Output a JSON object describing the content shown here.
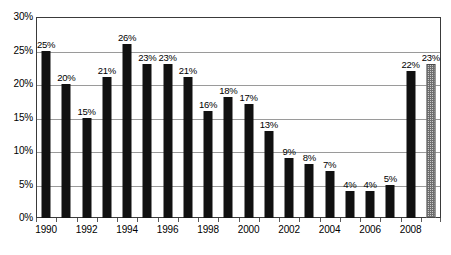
{
  "chart_data": {
    "type": "bar",
    "title": "",
    "subtitle": "",
    "xlabel": "",
    "ylabel": "",
    "categories": [
      "1990",
      "1991",
      "1992",
      "1993",
      "1994",
      "1995",
      "1996",
      "1997",
      "1998",
      "1999",
      "2000",
      "2001",
      "2002",
      "2003",
      "2004",
      "2005",
      "2006",
      "2007",
      "2008",
      "2009"
    ],
    "values": [
      25,
      20,
      15,
      21,
      26,
      23,
      23,
      21,
      16,
      18,
      17,
      13,
      9,
      8,
      7,
      4,
      4,
      5,
      22,
      23
    ],
    "data_labels": [
      "25%",
      "20%",
      "15%",
      "21%",
      "26%",
      "23%",
      "23%",
      "21%",
      "16%",
      "18%",
      "17%",
      "13%",
      "9%",
      "8%",
      "7%",
      "4%",
      "4%",
      "5%",
      "22%",
      "23%"
    ],
    "bar_styles": [
      "solid",
      "solid",
      "solid",
      "solid",
      "solid",
      "solid",
      "solid",
      "solid",
      "solid",
      "solid",
      "solid",
      "solid",
      "solid",
      "solid",
      "solid",
      "solid",
      "solid",
      "solid",
      "solid",
      "hatched"
    ],
    "ylim": [
      0,
      30
    ],
    "ytick_values": [
      0,
      5,
      10,
      15,
      20,
      25,
      30
    ],
    "ytick_labels": [
      "0%",
      "5%",
      "10%",
      "15%",
      "20%",
      "25%",
      "30%"
    ],
    "xtick_labels": [
      "1990",
      "1992",
      "1994",
      "1996",
      "1998",
      "2000",
      "2002",
      "2004",
      "2006",
      "2008"
    ],
    "xtick_indices": [
      0,
      2,
      4,
      6,
      8,
      10,
      12,
      14,
      16,
      18
    ],
    "grid": true,
    "legend": "none",
    "colors": {
      "bar_solid": "#111111",
      "bar_hatched_fill": "#c9c9c9",
      "bar_hatched_line": "#6e6e6e",
      "gridline": "#9a9a9a",
      "frame": "#3a3a3a",
      "text": "#000000",
      "background": "#ffffff"
    }
  }
}
